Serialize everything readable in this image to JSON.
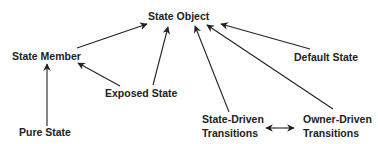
{
  "diagram": {
    "nodes": {
      "state_object": "State Object",
      "state_member": "State Member",
      "default_state": "Default State",
      "exposed_state": "Exposed State",
      "pure_state": "Pure State",
      "state_driven_1": "State-Driven",
      "state_driven_2": "Transitions",
      "owner_driven_1": "Owner-Driven",
      "owner_driven_2": "Transitions"
    },
    "edges": [
      {
        "from": "State Member",
        "to": "State Object"
      },
      {
        "from": "Exposed State",
        "to": "State Object"
      },
      {
        "from": "State-Driven Transitions",
        "to": "State Object"
      },
      {
        "from": "Owner-Driven Transitions",
        "to": "State Object"
      },
      {
        "from": "Default State",
        "to": "State Object"
      },
      {
        "from": "Exposed State",
        "to": "State Member"
      },
      {
        "from": "Pure State",
        "to": "State Member"
      },
      {
        "from": "State-Driven Transitions",
        "to": "Owner-Driven Transitions",
        "bidirectional": true
      }
    ],
    "colors": {
      "line": "#222222",
      "text": "#222222",
      "background": "#ffffff"
    }
  }
}
